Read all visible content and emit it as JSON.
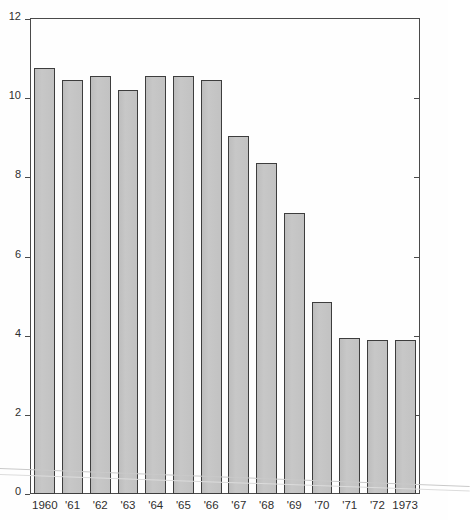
{
  "chart_data": {
    "type": "bar",
    "title": "",
    "xlabel": "",
    "ylabel": "",
    "categories": [
      "1960",
      "'61",
      "'62",
      "'63",
      "'64",
      "'65",
      "'66",
      "'67",
      "'68",
      "'69",
      "'70",
      "'71",
      "'72",
      "1973"
    ],
    "values": [
      10.75,
      10.45,
      10.55,
      10.2,
      10.55,
      10.55,
      10.45,
      9.05,
      8.35,
      7.1,
      4.85,
      3.95,
      3.9,
      3.9
    ],
    "ylim": [
      0,
      12
    ],
    "yticks": [
      "0",
      "2",
      "4",
      "6",
      "8",
      "10",
      "12"
    ],
    "ytick_values": [
      0,
      2,
      4,
      6,
      8,
      10,
      12
    ],
    "grid": false,
    "legend": null,
    "legend_position": "none",
    "annotations": []
  },
  "style": {
    "bar_fill": "#c3c3c3",
    "bar_border": "#3d3d3d",
    "axis_color": "#4a4a4a",
    "text_color": "#2e2e2e",
    "background": "#fefefe"
  }
}
